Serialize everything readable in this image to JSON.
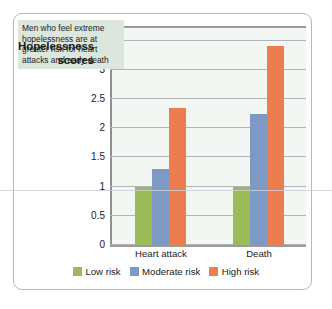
{
  "chart_data": {
    "type": "bar",
    "title": "",
    "xlabel": "",
    "ylabel": "Hopelessness scores",
    "categories": [
      "Heart attack",
      "Death"
    ],
    "series": [
      {
        "name": "Low risk",
        "color": "#9BBB59",
        "values": [
          1.0,
          1.0
        ]
      },
      {
        "name": "Moderate risk",
        "color": "#7E9AC4",
        "values": [
          1.3,
          2.25
        ]
      },
      {
        "name": "High risk",
        "color": "#ED7D4E",
        "values": [
          2.35,
          3.4
        ]
      }
    ],
    "ylim": [
      0,
      3.75
    ],
    "yticks": [
      "0",
      "0.5",
      "1",
      "1.5",
      "2",
      "2.5",
      "3",
      "3.5"
    ],
    "ytick_values": [
      0,
      0.5,
      1,
      1.5,
      2,
      2.5,
      3,
      3.5
    ],
    "grid": true,
    "legend_position": "bottom",
    "annotation": "Men who feel extreme hopelessness are at greater risk for heart attacks and early death"
  },
  "axis": {
    "title_line1": "Hopelessness",
    "title_line2": "scores"
  },
  "colors": {
    "low_risk": "#9BBB59",
    "moderate_risk": "#7E9AC4",
    "high_risk": "#ED7D4E",
    "plot_background": "#f3f7f3",
    "frame_border": "#a9bbd0",
    "annotation_background": "#dde6dd"
  }
}
